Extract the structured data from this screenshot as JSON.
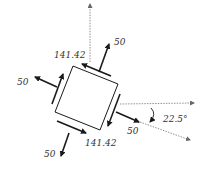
{
  "diagram": {
    "angle_label": "22.5°",
    "normal_stress_labels": {
      "top_right": "50",
      "left": "50",
      "right": "50",
      "bottom": "50"
    },
    "shear_stress_labels": {
      "top": "141.42",
      "bottom": "141.42"
    },
    "colors": {
      "line": "#1a1a1a",
      "axis": "#666666",
      "text": "#333333"
    }
  }
}
